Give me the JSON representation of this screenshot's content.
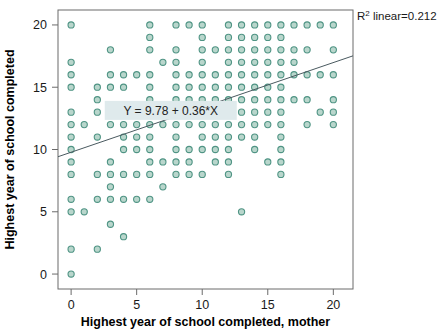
{
  "figure": {
    "background_color": "#ffffff",
    "marker_fill": "#b9d6cc",
    "marker_stroke": "#4f9484",
    "line_color": "#4a5a60",
    "axis_color": "#6b6b6b"
  },
  "labels": {
    "r2_prefix": "R",
    "r2_sup": "2",
    "r2_text": " linear=0.212",
    "equation": "Y = 9.78 + 0.36*X",
    "x_axis_title": "Highest year of school completed, mother",
    "y_axis_title": "Highest year of school completed"
  },
  "chart_data": {
    "type": "scatter",
    "title": "",
    "xlabel": "Highest year of school completed, mother",
    "ylabel": "Highest year of school completed",
    "xlim": [
      -1,
      21.5
    ],
    "ylim": [
      -1.2,
      21.2
    ],
    "xticks": [
      0,
      5,
      10,
      15,
      20
    ],
    "yticks": [
      0,
      5,
      10,
      15,
      20
    ],
    "grid": false,
    "legend": null,
    "annotations": [
      {
        "name": "r2-annotation",
        "text": "R² linear=0.212",
        "x": 21.8,
        "y": 20.2
      },
      {
        "name": "equation-annotation",
        "text": "Y = 9.78 + 0.36*X",
        "x": 7.6,
        "y": 13.1
      }
    ],
    "fit_line": {
      "name": "linear-regression-line",
      "intercept": 9.78,
      "slope": 0.36,
      "r_squared": 0.212,
      "x_start": -1,
      "x_end": 21.5
    },
    "series": [
      {
        "name": "observations",
        "marker": "open-circle",
        "points": [
          [
            0,
            20
          ],
          [
            6,
            20
          ],
          [
            8,
            20
          ],
          [
            9,
            20
          ],
          [
            10,
            20
          ],
          [
            12,
            20
          ],
          [
            13,
            20
          ],
          [
            14,
            20
          ],
          [
            15,
            20
          ],
          [
            16,
            20
          ],
          [
            17,
            20
          ],
          [
            18,
            20
          ],
          [
            19,
            20
          ],
          [
            20,
            20
          ],
          [
            6,
            19
          ],
          [
            10,
            19
          ],
          [
            12,
            19
          ],
          [
            13,
            19
          ],
          [
            14,
            19
          ],
          [
            15,
            19
          ],
          [
            16,
            19
          ],
          [
            3,
            18
          ],
          [
            6,
            18
          ],
          [
            8,
            18
          ],
          [
            10,
            18
          ],
          [
            11,
            18
          ],
          [
            12,
            18
          ],
          [
            13,
            18
          ],
          [
            14,
            18
          ],
          [
            15,
            18
          ],
          [
            16,
            18
          ],
          [
            17,
            18
          ],
          [
            18,
            18
          ],
          [
            20,
            18
          ],
          [
            0,
            17
          ],
          [
            7,
            17
          ],
          [
            8,
            17
          ],
          [
            10,
            17
          ],
          [
            12,
            17
          ],
          [
            13,
            17
          ],
          [
            14,
            17
          ],
          [
            15,
            17
          ],
          [
            16,
            17
          ],
          [
            17,
            17
          ],
          [
            0,
            16
          ],
          [
            3,
            16
          ],
          [
            4,
            16
          ],
          [
            5,
            16
          ],
          [
            6,
            16
          ],
          [
            8,
            16
          ],
          [
            9,
            16
          ],
          [
            10,
            16
          ],
          [
            11,
            16
          ],
          [
            12,
            16
          ],
          [
            13,
            16
          ],
          [
            14,
            16
          ],
          [
            15,
            16
          ],
          [
            16,
            16
          ],
          [
            17,
            16
          ],
          [
            18,
            16
          ],
          [
            19,
            16
          ],
          [
            20,
            16
          ],
          [
            0,
            15
          ],
          [
            2,
            15
          ],
          [
            3,
            15
          ],
          [
            4,
            15
          ],
          [
            6,
            15
          ],
          [
            8,
            15
          ],
          [
            9,
            15
          ],
          [
            10,
            15
          ],
          [
            11,
            15
          ],
          [
            12,
            15
          ],
          [
            13,
            15
          ],
          [
            14,
            15
          ],
          [
            15,
            15
          ],
          [
            16,
            15
          ],
          [
            2,
            14
          ],
          [
            6,
            14
          ],
          [
            8,
            14
          ],
          [
            9,
            14
          ],
          [
            10,
            14
          ],
          [
            11,
            14
          ],
          [
            12,
            14
          ],
          [
            13,
            14
          ],
          [
            14,
            14
          ],
          [
            15,
            14
          ],
          [
            16,
            14
          ],
          [
            17,
            14
          ],
          [
            18,
            14
          ],
          [
            20,
            14
          ],
          [
            0,
            13
          ],
          [
            2,
            13
          ],
          [
            3,
            13
          ],
          [
            4,
            13
          ],
          [
            5,
            13
          ],
          [
            6,
            13
          ],
          [
            7,
            13
          ],
          [
            8,
            13
          ],
          [
            9,
            13
          ],
          [
            10,
            13
          ],
          [
            11,
            13
          ],
          [
            12,
            13
          ],
          [
            13,
            13
          ],
          [
            14,
            13
          ],
          [
            15,
            13
          ],
          [
            16,
            13
          ],
          [
            19,
            13
          ],
          [
            20,
            13
          ],
          [
            0,
            12
          ],
          [
            1,
            12
          ],
          [
            3,
            12
          ],
          [
            4,
            12
          ],
          [
            5,
            12
          ],
          [
            6,
            12
          ],
          [
            7,
            12
          ],
          [
            8,
            12
          ],
          [
            9,
            12
          ],
          [
            10,
            12
          ],
          [
            11,
            12
          ],
          [
            12,
            12
          ],
          [
            13,
            12
          ],
          [
            14,
            12
          ],
          [
            15,
            12
          ],
          [
            16,
            12
          ],
          [
            18,
            12
          ],
          [
            20,
            12
          ],
          [
            0,
            11
          ],
          [
            2,
            11
          ],
          [
            4,
            11
          ],
          [
            5,
            11
          ],
          [
            6,
            11
          ],
          [
            8,
            11
          ],
          [
            10,
            11
          ],
          [
            11,
            11
          ],
          [
            12,
            11
          ],
          [
            13,
            11
          ],
          [
            14,
            11
          ],
          [
            16,
            11
          ],
          [
            0,
            10
          ],
          [
            4,
            10
          ],
          [
            5,
            10
          ],
          [
            6,
            10
          ],
          [
            8,
            10
          ],
          [
            9,
            10
          ],
          [
            10,
            10
          ],
          [
            11,
            10
          ],
          [
            12,
            10
          ],
          [
            14,
            10
          ],
          [
            16,
            10
          ],
          [
            0,
            9
          ],
          [
            3,
            9
          ],
          [
            6,
            9
          ],
          [
            7,
            9
          ],
          [
            8,
            9
          ],
          [
            9,
            9
          ],
          [
            11,
            9
          ],
          [
            12,
            9
          ],
          [
            15,
            9
          ],
          [
            16,
            9
          ],
          [
            0,
            8
          ],
          [
            2,
            8
          ],
          [
            3,
            8
          ],
          [
            4,
            8
          ],
          [
            5,
            8
          ],
          [
            6,
            8
          ],
          [
            8,
            8
          ],
          [
            9,
            8
          ],
          [
            10,
            8
          ],
          [
            12,
            8
          ],
          [
            16,
            8
          ],
          [
            3,
            7
          ],
          [
            7,
            7
          ],
          [
            0,
            6
          ],
          [
            2,
            6
          ],
          [
            3,
            6
          ],
          [
            4,
            6
          ],
          [
            5,
            6
          ],
          [
            6,
            6
          ],
          [
            0,
            5
          ],
          [
            1,
            5
          ],
          [
            13,
            5
          ],
          [
            3,
            4
          ],
          [
            4,
            3
          ],
          [
            0,
            2
          ],
          [
            2,
            2
          ],
          [
            0,
            0
          ]
        ]
      }
    ]
  }
}
